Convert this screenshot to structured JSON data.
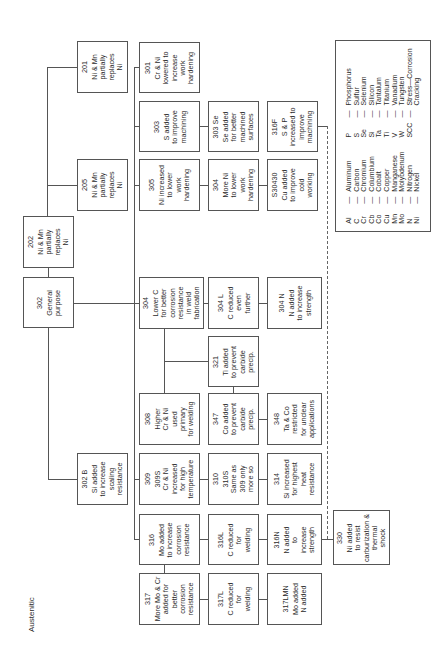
{
  "diagram": {
    "title": "Austenitic",
    "nodes": [
      {
        "id": "201",
        "lines": [
          "201",
          "Ni & Mn",
          "partially",
          "replaces",
          "Ni"
        ],
        "x": 77,
        "y": 41,
        "w": 51,
        "h": 52
      },
      {
        "id": "205",
        "lines": [
          "205",
          "Ni & Mn",
          "partially",
          "replaces",
          "Ni"
        ],
        "x": 77,
        "y": 159,
        "w": 51,
        "h": 52
      },
      {
        "id": "202",
        "lines": [
          "202",
          "Ni & Mn",
          "partially",
          "replaces",
          "Ni"
        ],
        "x": 23,
        "y": 216,
        "w": 51,
        "h": 52
      },
      {
        "id": "302",
        "lines": [
          "302",
          "General",
          "purpose"
        ],
        "x": 23,
        "y": 277,
        "w": 51,
        "h": 51
      },
      {
        "id": "302B",
        "lines": [
          "302 B",
          "Si added",
          "to increase",
          "scaling",
          "resistance"
        ],
        "x": 77,
        "y": 453,
        "w": 51,
        "h": 52
      },
      {
        "id": "301",
        "lines": [
          "301",
          "Cr & Ni",
          "lowered to",
          "increase",
          "work",
          "hardening"
        ],
        "x": 139,
        "y": 42,
        "w": 61,
        "h": 51
      },
      {
        "id": "303",
        "lines": [
          "303",
          "S added",
          "to improve",
          "machining"
        ],
        "x": 139,
        "y": 101,
        "w": 61,
        "h": 51
      },
      {
        "id": "303Se",
        "lines": [
          "303 Se",
          "Se added",
          "for better",
          "machined",
          "surfaces"
        ],
        "x": 208,
        "y": 101,
        "w": 51,
        "h": 51
      },
      {
        "id": "305",
        "lines": [
          "305",
          "Ni increased",
          "to lower",
          "work",
          "hardening"
        ],
        "x": 139,
        "y": 159,
        "w": 61,
        "h": 52
      },
      {
        "id": "304a",
        "lines": [
          "304",
          "More Ni",
          "to lower",
          "work",
          "hardening"
        ],
        "x": 208,
        "y": 159,
        "w": 51,
        "h": 52
      },
      {
        "id": "S30430",
        "lines": [
          "S30430",
          "Cu added",
          "to improve",
          "cold",
          "working"
        ],
        "x": 267,
        "y": 159,
        "w": 51,
        "h": 52
      },
      {
        "id": "316F",
        "lines": [
          "316F",
          "S & P",
          "increased to",
          "improve",
          "machining"
        ],
        "x": 267,
        "y": 101,
        "w": 51,
        "h": 51
      },
      {
        "id": "304",
        "lines": [
          "304",
          "Lower C",
          "for better",
          "corrosion",
          "resistance",
          "in weld",
          "fabrication"
        ],
        "x": 139,
        "y": 277,
        "w": 65,
        "h": 52
      },
      {
        "id": "304L",
        "lines": [
          "304 L",
          "C reduced",
          "even",
          "further"
        ],
        "x": 208,
        "y": 277,
        "w": 51,
        "h": 52
      },
      {
        "id": "304N",
        "lines": [
          "304 N",
          "N added",
          "to increase",
          "strength"
        ],
        "x": 267,
        "y": 277,
        "w": 55,
        "h": 52
      },
      {
        "id": "321",
        "lines": [
          "321",
          "Ti added",
          "to prevent",
          "carbide",
          "precip."
        ],
        "x": 208,
        "y": 336,
        "w": 51,
        "h": 51
      },
      {
        "id": "308",
        "lines": [
          "308",
          "Higher",
          "Cr & Ni",
          "used",
          "primary",
          "for welding"
        ],
        "x": 139,
        "y": 393,
        "w": 61,
        "h": 52
      },
      {
        "id": "347",
        "lines": [
          "347",
          "Co added",
          "to prevent",
          "carbide",
          "precip."
        ],
        "x": 208,
        "y": 393,
        "w": 51,
        "h": 52
      },
      {
        "id": "348",
        "lines": [
          "348",
          "Ta & Co",
          "restricted",
          "for unclear",
          "applications"
        ],
        "x": 267,
        "y": 393,
        "w": 55,
        "h": 52
      },
      {
        "id": "309",
        "lines": [
          "309",
          "309S",
          "Cr & Ni",
          "increased",
          "for high",
          "temperature"
        ],
        "x": 139,
        "y": 453,
        "w": 61,
        "h": 52
      },
      {
        "id": "310",
        "lines": [
          "310",
          "310S",
          "Same as",
          "309 only",
          "more so"
        ],
        "x": 208,
        "y": 453,
        "w": 51,
        "h": 52
      },
      {
        "id": "314",
        "lines": [
          "314",
          "Si increased",
          "for highest",
          "heat",
          "resistance"
        ],
        "x": 267,
        "y": 453,
        "w": 55,
        "h": 52
      },
      {
        "id": "316",
        "lines": [
          "316",
          "Mo added",
          "to increase",
          "corrosion",
          "resistance"
        ],
        "x": 139,
        "y": 514,
        "w": 61,
        "h": 51
      },
      {
        "id": "316L",
        "lines": [
          "316L",
          "C reduced",
          "for",
          "welding"
        ],
        "x": 208,
        "y": 514,
        "w": 51,
        "h": 51
      },
      {
        "id": "316N",
        "lines": [
          "316N",
          "N added",
          "to",
          "increase",
          "strength"
        ],
        "x": 267,
        "y": 514,
        "w": 55,
        "h": 51
      },
      {
        "id": "330",
        "lines": [
          "330",
          "Ni added",
          "to resist",
          "carburization &",
          "thermal",
          "shock"
        ],
        "x": 333,
        "y": 510,
        "w": 57,
        "h": 55
      },
      {
        "id": "317",
        "lines": [
          "317",
          "More Mo & Cr",
          "added for",
          "better",
          "corrosion",
          "resistance"
        ],
        "x": 139,
        "y": 573,
        "w": 61,
        "h": 52
      },
      {
        "id": "317L",
        "lines": [
          "317L",
          "C reduced",
          "for",
          "welding"
        ],
        "x": 208,
        "y": 573,
        "w": 51,
        "h": 52
      },
      {
        "id": "317LMN",
        "lines": [
          "317LMN",
          "Mo added",
          "N added"
        ],
        "x": 267,
        "y": 573,
        "w": 55,
        "h": 52
      }
    ],
    "legend": {
      "left": [
        {
          "sym": "Al",
          "name": "Aluminum"
        },
        {
          "sym": "C",
          "name": "Carbon"
        },
        {
          "sym": "Cr",
          "name": "Chromium"
        },
        {
          "sym": "Cb",
          "name": "Columbium"
        },
        {
          "sym": "Co",
          "name": "Cobalt"
        },
        {
          "sym": "Cu",
          "name": "Copper"
        },
        {
          "sym": "Mn",
          "name": "Manganese"
        },
        {
          "sym": "Mo",
          "name": "Molybdenum"
        },
        {
          "sym": "N",
          "name": "Nitrogen"
        },
        {
          "sym": "Ni",
          "name": "Nickel"
        }
      ],
      "right": [
        {
          "sym": "P",
          "name": "Phosphorus"
        },
        {
          "sym": "S",
          "name": "Sulfur"
        },
        {
          "sym": "Se",
          "name": "Selenium"
        },
        {
          "sym": "Si",
          "name": "Silicon"
        },
        {
          "sym": "Ta",
          "name": "Tantalum"
        },
        {
          "sym": "Ti",
          "name": "Titanium"
        },
        {
          "sym": "V",
          "name": "Vanadium"
        },
        {
          "sym": "W",
          "name": "Tungsten"
        },
        {
          "sym": "SCC",
          "name": "Stress—Corrosion"
        },
        {
          "sym": "",
          "name": "Cracking"
        }
      ],
      "separator": "—"
    }
  }
}
